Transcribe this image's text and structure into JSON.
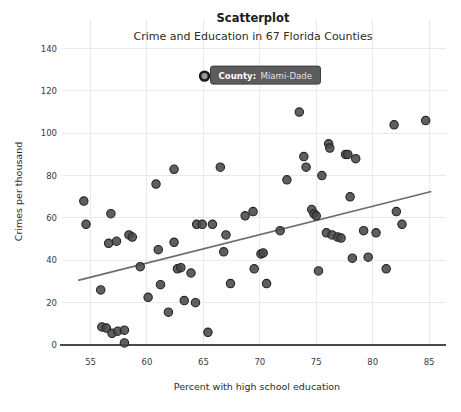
{
  "chart_data": {
    "type": "scatter",
    "title": "Scatterplot",
    "subtitle": "Crime and Education in 67 Florida Counties",
    "xlabel": "Percent with high school education",
    "ylabel": "Crimes per thousand",
    "xlim": [
      53.0,
      86.5
    ],
    "ylim": [
      0,
      145
    ],
    "xticks": [
      55,
      60,
      65,
      70,
      75,
      80,
      85
    ],
    "yticks": [
      0,
      20,
      40,
      60,
      80,
      100,
      120,
      140
    ],
    "grid": true,
    "legend": false,
    "point_color": "#494949",
    "point_edge_color": "#242424",
    "trendline_color": "#6d6d6d",
    "axis_color": "#4a4a4a",
    "grid_color": "#e9e9e9",
    "trendline": {
      "x_start": 53.9,
      "y_start": 30.5,
      "x_end": 85.2,
      "y_end": 72.5
    },
    "points": [
      {
        "x": 54.4,
        "y": 68.0
      },
      {
        "x": 54.6,
        "y": 57.0
      },
      {
        "x": 55.9,
        "y": 26.0
      },
      {
        "x": 56.0,
        "y": 8.5
      },
      {
        "x": 56.4,
        "y": 8.0
      },
      {
        "x": 56.6,
        "y": 48.0
      },
      {
        "x": 56.8,
        "y": 62.0
      },
      {
        "x": 56.9,
        "y": 5.5
      },
      {
        "x": 57.3,
        "y": 49.0
      },
      {
        "x": 57.4,
        "y": 6.5
      },
      {
        "x": 58.0,
        "y": 1.0
      },
      {
        "x": 58.0,
        "y": 7.0
      },
      {
        "x": 58.4,
        "y": 52.0
      },
      {
        "x": 58.7,
        "y": 51.0
      },
      {
        "x": 59.4,
        "y": 37.0
      },
      {
        "x": 60.1,
        "y": 22.5
      },
      {
        "x": 60.8,
        "y": 76.0
      },
      {
        "x": 61.0,
        "y": 45.0
      },
      {
        "x": 61.2,
        "y": 28.5
      },
      {
        "x": 61.9,
        "y": 15.5
      },
      {
        "x": 62.4,
        "y": 83.0
      },
      {
        "x": 62.4,
        "y": 48.5
      },
      {
        "x": 62.7,
        "y": 36.0
      },
      {
        "x": 63.0,
        "y": 36.5
      },
      {
        "x": 63.3,
        "y": 21.0
      },
      {
        "x": 63.9,
        "y": 34.0
      },
      {
        "x": 64.3,
        "y": 20.0
      },
      {
        "x": 64.4,
        "y": 57.0
      },
      {
        "x": 64.9,
        "y": 57.0
      },
      {
        "x": 65.1,
        "y": 127.0
      },
      {
        "x": 65.4,
        "y": 6.0
      },
      {
        "x": 65.8,
        "y": 57.0
      },
      {
        "x": 66.5,
        "y": 84.0
      },
      {
        "x": 66.8,
        "y": 44.0
      },
      {
        "x": 67.0,
        "y": 52.0
      },
      {
        "x": 67.4,
        "y": 29.0
      },
      {
        "x": 68.7,
        "y": 61.0
      },
      {
        "x": 69.4,
        "y": 63.0
      },
      {
        "x": 69.5,
        "y": 36.0
      },
      {
        "x": 70.1,
        "y": 43.0
      },
      {
        "x": 70.3,
        "y": 43.5
      },
      {
        "x": 70.6,
        "y": 29.0
      },
      {
        "x": 71.8,
        "y": 54.0
      },
      {
        "x": 72.4,
        "y": 78.0
      },
      {
        "x": 73.5,
        "y": 110.0
      },
      {
        "x": 73.9,
        "y": 89.0
      },
      {
        "x": 74.1,
        "y": 84.0
      },
      {
        "x": 74.6,
        "y": 64.0
      },
      {
        "x": 74.8,
        "y": 62.0
      },
      {
        "x": 75.0,
        "y": 61.0
      },
      {
        "x": 75.2,
        "y": 35.0
      },
      {
        "x": 75.5,
        "y": 80.0
      },
      {
        "x": 75.9,
        "y": 53.0
      },
      {
        "x": 76.1,
        "y": 95.0
      },
      {
        "x": 76.2,
        "y": 93.0
      },
      {
        "x": 76.4,
        "y": 52.0
      },
      {
        "x": 76.9,
        "y": 51.0
      },
      {
        "x": 77.2,
        "y": 50.5
      },
      {
        "x": 77.6,
        "y": 90.0
      },
      {
        "x": 77.8,
        "y": 90.0
      },
      {
        "x": 78.0,
        "y": 70.0
      },
      {
        "x": 78.2,
        "y": 41.0
      },
      {
        "x": 78.5,
        "y": 88.0
      },
      {
        "x": 79.2,
        "y": 54.0
      },
      {
        "x": 79.6,
        "y": 41.5
      },
      {
        "x": 80.3,
        "y": 53.0
      },
      {
        "x": 81.2,
        "y": 36.0
      },
      {
        "x": 81.9,
        "y": 104.0
      },
      {
        "x": 82.1,
        "y": 63.0
      },
      {
        "x": 82.6,
        "y": 57.0
      },
      {
        "x": 84.7,
        "y": 106.0
      }
    ],
    "highlighted_point": {
      "x": 65.1,
      "y": 127.0,
      "label": "Miami-Dade"
    }
  },
  "tooltip": {
    "key": "County:",
    "value": "Miami-Dade"
  }
}
